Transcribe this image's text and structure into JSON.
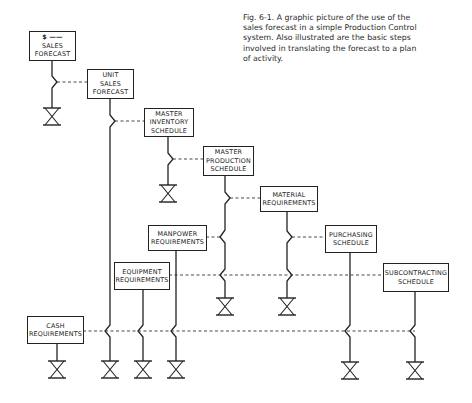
{
  "caption": {
    "lines": [
      "Fig. 6-1.  A graphic picture of the use of the",
      "sales forecast in a simple Production Control",
      "system.  Also illustrated are the basic steps",
      "involved in translating the forecast to a plan",
      "of activity."
    ]
  },
  "boxes": {
    "sales_forecast": {
      "lines": [
        "$ ——",
        "SALES",
        "FORECAST"
      ]
    },
    "unit_sales_forecast": {
      "lines": [
        "UNIT",
        "SALES",
        "FORECAST"
      ]
    },
    "master_inventory_schedule": {
      "lines": [
        "MASTER",
        "INVENTORY",
        "SCHEDULE"
      ]
    },
    "master_production_schedule": {
      "lines": [
        "MASTER",
        "PRODUCTION",
        "SCHEDULE"
      ]
    },
    "material_requirements": {
      "lines": [
        "MATERIAL",
        "REQUIREMENTS"
      ]
    },
    "manpower_requirements": {
      "lines": [
        "MANPOWER",
        "REQUIREMENTS"
      ]
    },
    "purchasing_schedule": {
      "lines": [
        "PURCHASING",
        "SCHEDULE"
      ]
    },
    "equipment_requirements": {
      "lines": [
        "EQUIPMENT",
        "REQUIREMENTS"
      ]
    },
    "subcontracting_schedule": {
      "lines": [
        "SUBCONTRACTING",
        "SCHEDULE"
      ]
    },
    "cash_requirements": {
      "lines": [
        "CASH",
        "REQUIREMENTS"
      ]
    }
  },
  "symbols": {
    "line_color": "#222222",
    "valve_icon": "hourglass-valve-icon",
    "branch_icon": "zigzag-branch-icon"
  }
}
